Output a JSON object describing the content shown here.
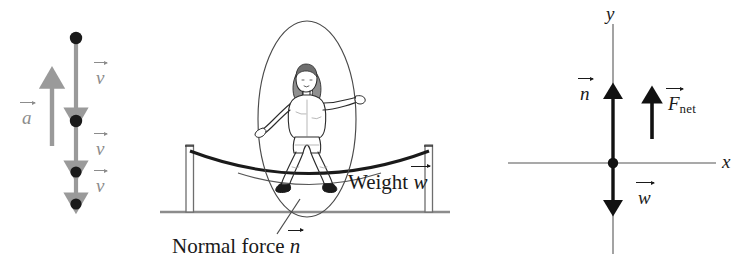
{
  "figure": {
    "panels": {
      "motion_diagram": {
        "name": "motion diagram",
        "acceleration_label": "a",
        "velocity_labels": [
          "v",
          "v",
          "v"
        ],
        "dot_count": 4,
        "acceleration_direction": "up",
        "velocity_direction": "down",
        "vector_color": "#9a9a9a",
        "dot_color": "#1a1a1a"
      },
      "pictorial": {
        "name": "trampoline scene",
        "weight_label_text": "Weight",
        "weight_label_symbol": "w",
        "normal_force_label_text": "Normal force",
        "normal_force_label_symbol": "n",
        "has_person": true,
        "has_trampoline": true,
        "has_ground": true,
        "highlight_shape": "ellipse"
      },
      "free_body": {
        "name": "free-body diagram",
        "axis_x_label": "x",
        "axis_y_label": "y",
        "normal_force_symbol": "n",
        "weight_symbol": "w",
        "net_force_symbol": "F",
        "net_force_subscript": "net",
        "normal_direction": "up",
        "weight_direction": "down",
        "net_force_direction": "up",
        "axis_color": "#8c8c8c",
        "force_color": "#111111"
      }
    }
  }
}
